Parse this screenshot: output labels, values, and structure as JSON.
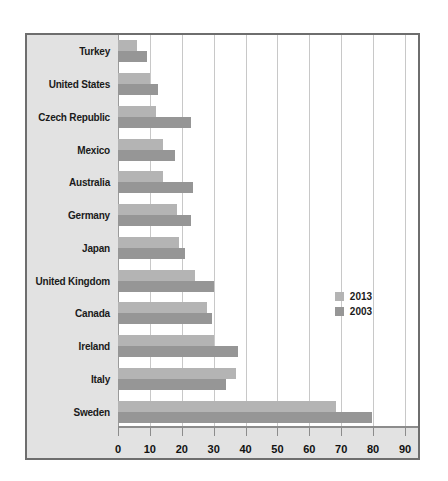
{
  "chart_data": {
    "type": "bar",
    "orientation": "horizontal",
    "title": "",
    "xlabel": "",
    "ylabel": "",
    "xlim": [
      0,
      90
    ],
    "xticks": [
      0,
      10,
      20,
      30,
      40,
      50,
      60,
      70,
      80,
      90
    ],
    "grid": true,
    "legend_position": "middle-right",
    "categories": [
      "Turkey",
      "United States",
      "Czech Republic",
      "Mexico",
      "Australia",
      "Germany",
      "Japan",
      "United Kingdom",
      "Canada",
      "Ireland",
      "Italy",
      "Sweden"
    ],
    "series": [
      {
        "name": "2013",
        "color": "#b4b4b4",
        "values": [
          6,
          10,
          12,
          14,
          14,
          18.5,
          19,
          24,
          28,
          30,
          37,
          68.5
        ]
      },
      {
        "name": "2003",
        "color": "#969696",
        "values": [
          9,
          12.5,
          23,
          18,
          23.5,
          23,
          21,
          30,
          29.5,
          37.5,
          34,
          79.5
        ]
      }
    ]
  },
  "legend": {
    "entries": [
      {
        "label": "2013",
        "color": "#b4b4b4"
      },
      {
        "label": "2003",
        "color": "#969696"
      }
    ]
  }
}
